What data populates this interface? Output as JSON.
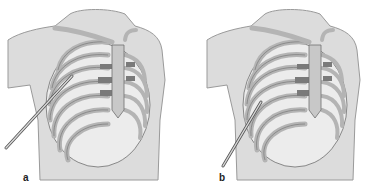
{
  "figure": {
    "panels": [
      {
        "id": "a",
        "label": "a",
        "needle_entry": "upper",
        "description": "Chest wall with rib cage, needle inserted at upper lateral intercostal space"
      },
      {
        "id": "b",
        "label": "b",
        "needle_entry": "lower",
        "description": "Chest wall with rib cage, needle inserted at lower lateral intercostal space"
      }
    ],
    "colors": {
      "skin": "#dcdcdc",
      "skin_outline": "#9a9a9a",
      "rib": "#b4b4b4",
      "rib_outline": "#6e6e6e",
      "cartilage": "#7a7a7a",
      "intercostal": "#ececec",
      "needle": "#d8d8d8",
      "needle_outline": "#555555"
    }
  }
}
